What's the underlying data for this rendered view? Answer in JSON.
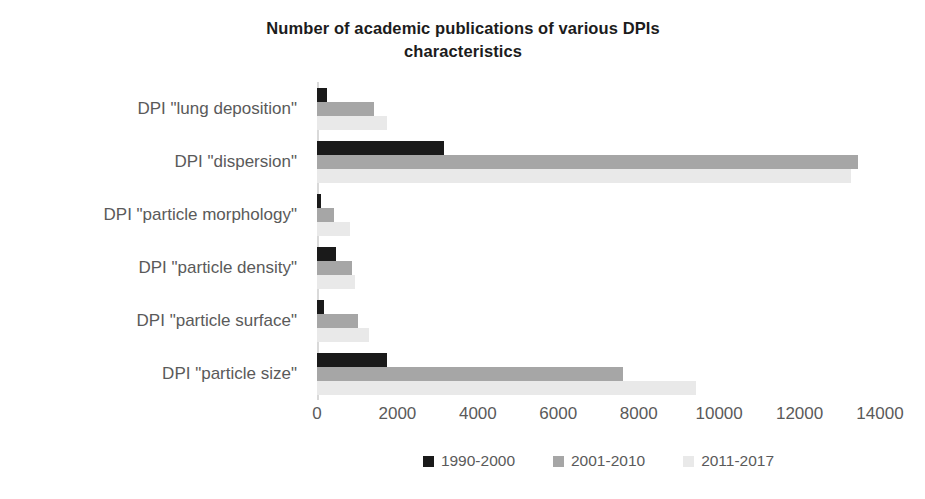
{
  "chart_data": {
    "type": "bar",
    "orientation": "horizontal",
    "title": "Number of academic publications of various DPIs characteristics",
    "xlabel": "",
    "ylabel": "",
    "xlim": [
      0,
      14000
    ],
    "xticks": [
      0,
      2000,
      4000,
      6000,
      8000,
      10000,
      12000,
      14000
    ],
    "xtick_labels": [
      "0",
      "2000",
      "4000",
      "6000",
      "8000",
      "10000",
      "12000",
      "14000"
    ],
    "grid": false,
    "legend_position": "bottom",
    "categories": [
      "DPI \"lung deposition\"",
      "DPI \"dispersion\"",
      "DPI \"particle morphology\"",
      "DPI \"particle density\"",
      "DPI \"particle surface\"",
      "DPI \"particle size\""
    ],
    "series": [
      {
        "name": "1990-2000",
        "color": "#1a1a1a",
        "values": [
          250,
          3150,
          90,
          470,
          180,
          1750
        ]
      },
      {
        "name": "2001-2010",
        "color": "#a6a6a6",
        "values": [
          1420,
          13450,
          430,
          870,
          1020,
          7620
        ]
      },
      {
        "name": "2011-2017",
        "color": "#e9e9e9",
        "values": [
          1740,
          13280,
          820,
          950,
          1300,
          9420
        ]
      }
    ]
  },
  "colors": {
    "series_1990_2000": "#1a1a1a",
    "series_2001_2010": "#a6a6a6",
    "series_2011_2017": "#e9e9e9",
    "axis": "#d9d9d9",
    "text": "#5a5a5a",
    "title_text": "#1c1c1c",
    "background": "#ffffff"
  }
}
